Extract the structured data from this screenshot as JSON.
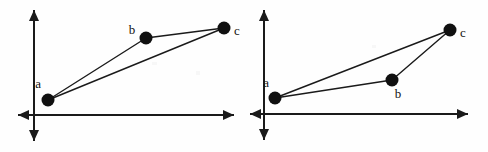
{
  "figure": {
    "type": "geometry-diagram",
    "background_color": "#fefefe",
    "stroke_color": "#1a1a1a",
    "point_fill_color": "#101010",
    "axis_stroke_width": 2,
    "edge_stroke_width": 1.4,
    "point_radius": 6.5,
    "panels": [
      {
        "id": "panel-left",
        "name": "left-panel",
        "axes": {
          "origin": {
            "x": 34,
            "y": 115
          },
          "x_axis": {
            "x1": 18,
            "y1": 115,
            "x2": 234,
            "y2": 115,
            "arrow_start": true,
            "arrow_end": true
          },
          "y_axis": {
            "x1": 34,
            "y1": 10,
            "x2": 34,
            "y2": 141,
            "arrow_start": true,
            "arrow_end": true
          }
        },
        "points": [
          {
            "id": "a",
            "label": "a",
            "x": 48,
            "y": 100,
            "label_x": 41,
            "label_y": 88,
            "label_anchor": "end"
          },
          {
            "id": "b",
            "label": "b",
            "x": 146,
            "y": 38,
            "label_x": 132,
            "label_y": 34,
            "label_anchor": "middle"
          },
          {
            "id": "c",
            "label": "c",
            "x": 224,
            "y": 28,
            "label_x": 234,
            "label_y": 35,
            "label_anchor": "start"
          }
        ],
        "edges": [
          {
            "from": "a",
            "to": "b"
          },
          {
            "from": "b",
            "to": "c"
          },
          {
            "from": "a",
            "to": "c"
          }
        ]
      },
      {
        "id": "panel-right",
        "name": "right-panel",
        "axes": {
          "origin": {
            "x": 20,
            "y": 114
          },
          "x_axis": {
            "x1": 6,
            "y1": 114,
            "x2": 224,
            "y2": 114,
            "arrow_start": true,
            "arrow_end": true
          },
          "y_axis": {
            "x1": 20,
            "y1": 10,
            "x2": 20,
            "y2": 140,
            "arrow_start": true,
            "arrow_end": true
          }
        },
        "points": [
          {
            "id": "a",
            "label": "a",
            "x": 31,
            "y": 98,
            "label_x": 25,
            "label_y": 87,
            "label_anchor": "end"
          },
          {
            "id": "b",
            "label": "b",
            "x": 148,
            "y": 80,
            "label_x": 154,
            "label_y": 98,
            "label_anchor": "middle"
          },
          {
            "id": "c",
            "label": "c",
            "x": 206,
            "y": 30,
            "label_x": 216,
            "label_y": 37,
            "label_anchor": "start"
          }
        ],
        "edges": [
          {
            "from": "a",
            "to": "b"
          },
          {
            "from": "b",
            "to": "c"
          },
          {
            "from": "a",
            "to": "c"
          }
        ]
      }
    ]
  }
}
